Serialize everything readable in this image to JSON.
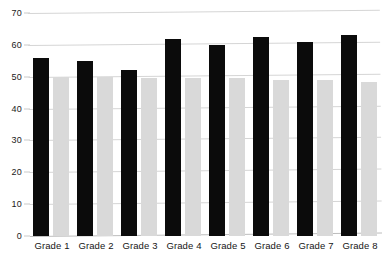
{
  "chart_data": {
    "type": "bar",
    "title": "",
    "xlabel": "",
    "ylabel": "",
    "ylim": [
      0,
      70
    ],
    "yticks": [
      0,
      10,
      20,
      30,
      40,
      50,
      60,
      70
    ],
    "grid": true,
    "legend": "none",
    "categories": [
      "Grade 1",
      "Grade 2",
      "Grade 3",
      "Grade 4",
      "Grade 5",
      "Grade 6",
      "Grade 7",
      "Grade 8"
    ],
    "series": [
      {
        "name": "Series 1",
        "color": "#0b0b0b",
        "values": [
          56,
          55,
          52,
          62,
          60,
          62.5,
          61,
          63
        ]
      },
      {
        "name": "Series 2",
        "color": "#d9d9d9",
        "values": [
          50,
          50,
          49.5,
          49.5,
          49.5,
          49,
          49,
          48.5
        ]
      }
    ]
  },
  "axis": {
    "tick_labels": [
      "70",
      "60",
      "50",
      "40",
      "30",
      "20",
      "10",
      "0"
    ]
  },
  "colors": {
    "series_dark": "#0b0b0b",
    "series_light": "#d9d9d9",
    "gridline": "#d5d5d5",
    "baseline": "#bdbdbd",
    "text": "#1a1a1a",
    "background": "#ffffff"
  }
}
